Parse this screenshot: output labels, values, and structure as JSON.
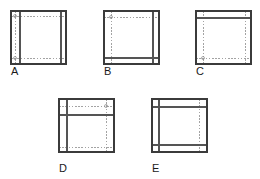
{
  "figure": {
    "title": "",
    "background_color": "#ffffff",
    "solid_line_color": "#555555",
    "outline_color": "#3b3b3b",
    "dotted_line_color": "#8c8c8c",
    "label_color": "#1a1a1a",
    "panel_count": 5,
    "panels": [
      {
        "id": "A",
        "label": "A",
        "label_x": 11,
        "label_y": 66,
        "square": {
          "x": 11,
          "y": 11,
          "w": 55,
          "h": 53
        },
        "solid_lines": [
          {
            "orientation": "vertical",
            "pos": 20
          },
          {
            "orientation": "vertical",
            "pos": 61
          }
        ],
        "dotted_lines": [
          {
            "orientation": "vertical",
            "pos": 15
          },
          {
            "orientation": "horizontal",
            "pos": 16
          },
          {
            "orientation": "horizontal",
            "pos": 58
          }
        ],
        "markers": [
          {
            "x": 15,
            "y": 16
          },
          {
            "x": 15,
            "y": 58
          }
        ]
      },
      {
        "id": "B",
        "label": "B",
        "label_x": 104,
        "label_y": 66,
        "square": {
          "x": 104,
          "y": 11,
          "w": 55,
          "h": 53
        },
        "solid_lines": [
          {
            "orientation": "vertical",
            "pos": 153
          },
          {
            "orientation": "horizontal",
            "pos": 58
          }
        ],
        "dotted_lines": [
          {
            "orientation": "vertical",
            "pos": 111
          },
          {
            "orientation": "horizontal",
            "pos": 17
          }
        ],
        "markers": [
          {
            "x": 111,
            "y": 17
          }
        ]
      },
      {
        "id": "C",
        "label": "C",
        "label_x": 196,
        "label_y": 66,
        "square": {
          "x": 196,
          "y": 11,
          "w": 55,
          "h": 53
        },
        "solid_lines": [
          {
            "orientation": "horizontal",
            "pos": 18
          }
        ],
        "dotted_lines": [
          {
            "orientation": "vertical",
            "pos": 203
          },
          {
            "orientation": "vertical",
            "pos": 245
          },
          {
            "orientation": "horizontal",
            "pos": 58
          }
        ],
        "markers": [
          {
            "x": 203,
            "y": 58
          }
        ]
      },
      {
        "id": "D",
        "label": "D",
        "label_x": 59,
        "label_y": 163,
        "square": {
          "x": 59,
          "y": 99,
          "w": 55,
          "h": 53
        },
        "solid_lines": [
          {
            "orientation": "horizontal",
            "pos": 115
          },
          {
            "orientation": "vertical",
            "pos": 67
          }
        ],
        "dotted_lines": [
          {
            "orientation": "horizontal",
            "pos": 106
          },
          {
            "orientation": "vertical",
            "pos": 106
          },
          {
            "orientation": "horizontal",
            "pos": 147
          }
        ],
        "markers": [
          {
            "x": 106,
            "y": 106
          }
        ]
      },
      {
        "id": "E",
        "label": "E",
        "label_x": 152,
        "label_y": 163,
        "square": {
          "x": 152,
          "y": 99,
          "w": 55,
          "h": 53
        },
        "solid_lines": [
          {
            "orientation": "horizontal",
            "pos": 107
          },
          {
            "orientation": "horizontal",
            "pos": 145
          },
          {
            "orientation": "vertical",
            "pos": 159
          }
        ],
        "dotted_lines": [
          {
            "orientation": "vertical",
            "pos": 199
          }
        ],
        "markers": []
      }
    ]
  }
}
